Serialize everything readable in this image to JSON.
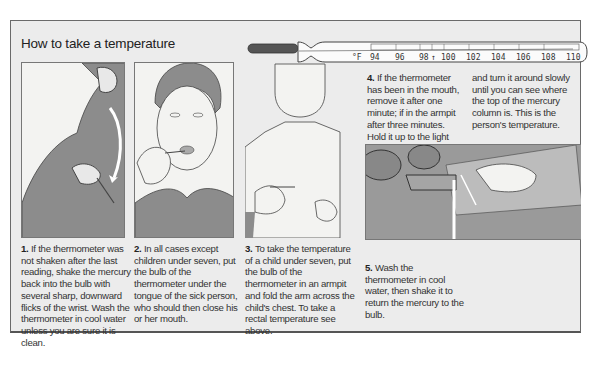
{
  "title": "How to take a temperature",
  "thermometer": {
    "unit": "°F",
    "scale": [
      "94",
      "96",
      "98",
      "100",
      "102",
      "104",
      "106",
      "108",
      "110"
    ],
    "normal_marker": "↑"
  },
  "steps": [
    {
      "number": "1.",
      "text": "If the thermometer was not shaken after the last reading, shake the mercury back into the bulb with several sharp, downward flicks of the wrist. Wash the thermometer in cool water unless you are sure it is clean."
    },
    {
      "number": "2.",
      "text": "In all cases except children under seven, put the bulb of the thermometer under the tongue of the sick person, who should then close his or her mouth."
    },
    {
      "number": "3.",
      "text": "To take the temperature of a child under seven, put the bulb of the thermometer in an armpit and fold the arm across the child's chest. To take a rectal temperature see above."
    },
    {
      "number": "4.",
      "text": "If the thermometer has been in the mouth, remove it after one minute; if in the armpit after three minutes. Hold it up to the light",
      "text_cont": "and turn it around slowly until you can see where the top of the mercury column is. This is the person's temperature."
    },
    {
      "number": "5.",
      "text": "Wash the thermometer in cool water, then shake it to return the mercury to the bulb."
    }
  ],
  "illustrations": [
    {
      "name": "shaking-thermometer"
    },
    {
      "name": "oral-thermometer"
    },
    {
      "name": "armpit-thermometer"
    },
    {
      "name": "washing-thermometer"
    }
  ]
}
